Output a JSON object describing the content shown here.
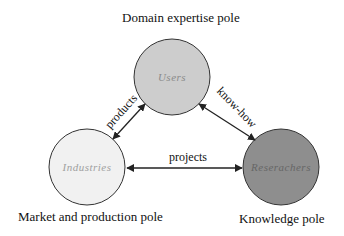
{
  "poles": {
    "top": "Domain expertise pole",
    "left": "Market and production pole",
    "right": "Knowledge pole"
  },
  "nodes": [
    {
      "id": "users",
      "label": "Users",
      "fill": "#cdcdcd",
      "text_color": "#8a8a8a"
    },
    {
      "id": "industries",
      "label": "Industries",
      "fill": "#f1f1f1",
      "text_color": "#a0a0a0"
    },
    {
      "id": "researchers",
      "label": "Reserachers",
      "fill": "#8e8e8e",
      "text_color": "#6a6a6a"
    }
  ],
  "edges": [
    {
      "from": "industries",
      "to": "users",
      "label": "products"
    },
    {
      "from": "users",
      "to": "researchers",
      "label": "know-how"
    },
    {
      "from": "industries",
      "to": "researchers",
      "label": "projects"
    }
  ]
}
